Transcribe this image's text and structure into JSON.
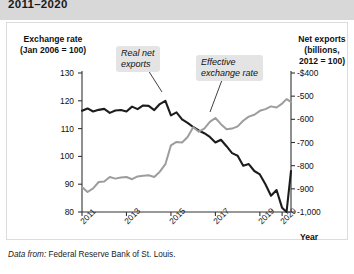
{
  "title": "2011–2020",
  "axes": {
    "left_title": "Exchange rate\n(Jan 2006 = 100)",
    "left_title_line1": "Exchange rate",
    "left_title_line2": "(Jan 2006 = 100)",
    "right_title_line1": "Net exports",
    "right_title_line2": "(billions,",
    "right_title_line3": "2012 = 100)",
    "x_title": "Year"
  },
  "source": {
    "prefix": "Data from:",
    "text": "Federal Reserve Bank of St. Louis."
  },
  "annotations": {
    "net_exports_line1": "Real net",
    "net_exports_line2": "exports",
    "exchange_rate_line1": "Effective",
    "exchange_rate_line2": "exchange rate"
  },
  "colors": {
    "net_exports_line": "#1c1c1c",
    "exchange_rate_line": "#9d9d9d",
    "title_band": "#d8d8d8",
    "callout_bg": "#e4e4e4",
    "axis": "#333333",
    "plate_border": "#dcdcdc"
  },
  "chart_data": {
    "type": "line",
    "title": "2011–2020",
    "xlabel": "Year",
    "ylabel": "Exchange rate (Jan 2006 = 100)",
    "y2label": "Net exports (billions, 2012 = 100)",
    "grid": false,
    "legend": "annotations",
    "xlim": [
      2011.0,
      2020.4
    ],
    "ylim": [
      80,
      130
    ],
    "y2lim": [
      -1000,
      -400
    ],
    "yticks": [
      80,
      90,
      100,
      110,
      120,
      130
    ],
    "yticklabels": [
      "80",
      "90",
      "100",
      "110",
      "120",
      "130"
    ],
    "y2ticks": [
      -1000,
      -900,
      -800,
      -700,
      -600,
      -500,
      -400
    ],
    "y2ticklabels": [
      "-1,000",
      "-900",
      "-800",
      "-700",
      "-600",
      "-500",
      "-$400"
    ],
    "xticks": [
      2011,
      2013,
      2015,
      2017,
      2019,
      2020
    ],
    "xticklabels": [
      "2011",
      "2013",
      "2015",
      "2017",
      "2019",
      "2020"
    ],
    "series": [
      {
        "name": "Real net exports",
        "axis": "right",
        "color": "#1c1c1c",
        "label_text": "Real net exports",
        "x": [
          2011.0,
          2011.25,
          2011.5,
          2011.75,
          2012.0,
          2012.25,
          2012.5,
          2012.75,
          2013.0,
          2013.25,
          2013.5,
          2013.75,
          2014.0,
          2014.25,
          2014.5,
          2014.75,
          2015.0,
          2015.25,
          2015.5,
          2015.75,
          2016.0,
          2016.25,
          2016.5,
          2016.75,
          2017.0,
          2017.25,
          2017.5,
          2017.75,
          2018.0,
          2018.25,
          2018.5,
          2018.75,
          2019.0,
          2019.25,
          2019.5,
          2019.75,
          2020.0,
          2020.2,
          2020.4
        ],
        "values_secondary": [
          -563,
          -553,
          -566,
          -559,
          -555,
          -572,
          -562,
          -560,
          -566,
          -545,
          -556,
          -540,
          -542,
          -560,
          -534,
          -520,
          -583,
          -570,
          -600,
          -615,
          -633,
          -648,
          -660,
          -676,
          -700,
          -688,
          -716,
          -746,
          -757,
          -800,
          -793,
          -823,
          -838,
          -880,
          -930,
          -905,
          -982,
          -1000,
          -823
        ]
      },
      {
        "name": "Effective exchange rate",
        "axis": "left",
        "color": "#9d9d9d",
        "label_text": "Effective exchange rate",
        "x": [
          2011.0,
          2011.25,
          2011.5,
          2011.75,
          2012.0,
          2012.25,
          2012.5,
          2012.75,
          2013.0,
          2013.25,
          2013.5,
          2013.75,
          2014.0,
          2014.25,
          2014.5,
          2014.75,
          2015.0,
          2015.25,
          2015.5,
          2015.75,
          2016.0,
          2016.25,
          2016.5,
          2016.75,
          2017.0,
          2017.25,
          2017.5,
          2017.75,
          2018.0,
          2018.25,
          2018.5,
          2018.75,
          2019.0,
          2019.25,
          2019.5,
          2019.75,
          2020.0,
          2020.2,
          2020.4
        ],
        "values": [
          89.0,
          87.2,
          88.5,
          90.8,
          91.0,
          92.6,
          92.0,
          92.4,
          92.6,
          91.8,
          92.8,
          93.0,
          93.2,
          92.6,
          94.5,
          97.2,
          104.0,
          105.2,
          105.0,
          107.0,
          110.5,
          108.9,
          110.0,
          112.4,
          113.8,
          111.6,
          109.8,
          110.0,
          110.8,
          112.8,
          114.3,
          115.0,
          116.4,
          117.0,
          118.0,
          117.6,
          119.0,
          120.6,
          119.6
        ]
      }
    ]
  }
}
